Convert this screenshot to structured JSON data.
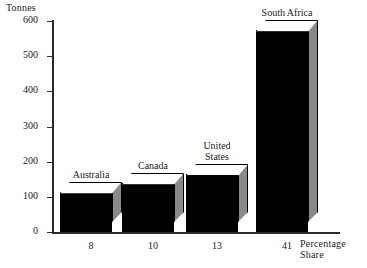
{
  "chart_data": {
    "type": "bar",
    "title": "",
    "ylabel": "Tonnes",
    "xlabel": "Percentage Share",
    "categories": [
      "Australia",
      "Canada",
      "United States",
      "South Africa"
    ],
    "values": [
      115,
      140,
      165,
      575
    ],
    "x_tick_labels": [
      "8",
      "10",
      "13",
      "41"
    ],
    "y_tick_labels": [
      "0",
      "100",
      "200",
      "300",
      "400",
      "500",
      "600"
    ],
    "y_ticks": [
      0,
      100,
      200,
      300,
      400,
      500,
      600
    ],
    "ylim": [
      0,
      600
    ],
    "grid": false,
    "legend": false,
    "style": "3d-bar",
    "colors": {
      "bar_front": "#000000",
      "bar_top": "#ffffff",
      "bar_side": "#8a8a8a",
      "axis": "#2b2b2b",
      "background": "#ffffff"
    }
  },
  "bars": [
    {
      "label": "Australia",
      "value": 115,
      "x_tick": "8",
      "label_lines": "Australia"
    },
    {
      "label": "Canada",
      "value": 140,
      "x_tick": "10",
      "label_lines": "Canada"
    },
    {
      "label": "United States",
      "value": 165,
      "x_tick": "13",
      "label_lines": "United\nStates"
    },
    {
      "label": "South Africa",
      "value": 575,
      "x_tick": "41",
      "label_lines": "South Africa"
    }
  ],
  "y_axis": {
    "title": "Tonnes",
    "ticks": [
      {
        "label": "600",
        "value": 600
      },
      {
        "label": "500",
        "value": 500
      },
      {
        "label": "400",
        "value": 400
      },
      {
        "label": "300",
        "value": 300
      },
      {
        "label": "200",
        "value": 200
      },
      {
        "label": "100",
        "value": 100
      },
      {
        "label": "0",
        "value": 0
      }
    ]
  },
  "x_axis": {
    "title": "Percentage Share"
  }
}
